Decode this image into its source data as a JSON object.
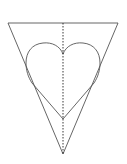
{
  "diagram": {
    "colors": {
      "background": "#ffffff",
      "outline": "#555555",
      "fold_line": "#222222"
    },
    "triangle": {
      "top_left": [
        8,
        23
      ],
      "top_right": [
        118,
        23
      ],
      "apex": [
        63,
        154
      ]
    },
    "heart": {
      "notch": [
        63,
        54
      ],
      "bottom_point": [
        63,
        119
      ],
      "left_extent": 26,
      "right_extent": 100,
      "lobe_top_y": 43
    },
    "fold_line": {
      "x": 63,
      "y1": 23,
      "y2": 154,
      "style": "dashed"
    }
  }
}
